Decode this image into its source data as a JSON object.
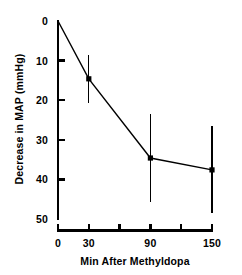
{
  "chart_data": {
    "type": "line",
    "title": "",
    "subtitle": "",
    "xlabel": "Min After Methyldopa",
    "ylabel": "Decrease in MAP (mmHg)",
    "xlim": [
      0,
      150
    ],
    "ylim": [
      0,
      50
    ],
    "y_axis_inverted": true,
    "grid": false,
    "legend": "none",
    "line_color": "#000000",
    "marker_color": "#000000",
    "marker": "square",
    "errorbar_style": "plain-vertical-no-caps",
    "x_ticks": [
      0,
      30,
      60,
      90,
      120,
      150
    ],
    "x_tick_labels": [
      "0",
      "30",
      "",
      "90",
      "",
      "150"
    ],
    "y_ticks": [
      0,
      10,
      20,
      30,
      40,
      50
    ],
    "y_tick_labels": [
      "0",
      "10",
      "20",
      "30",
      "40",
      "50"
    ],
    "x": [
      0,
      30,
      90,
      150
    ],
    "values": [
      0,
      14.6,
      34.6,
      37.6
    ],
    "errors": [
      0,
      6.0,
      11.0,
      11.0
    ],
    "points": [
      {
        "x": 0,
        "y": 0,
        "err": 0,
        "marker": false
      },
      {
        "x": 30,
        "y": 14.6,
        "err": 6.0,
        "marker": true
      },
      {
        "x": 90,
        "y": 34.6,
        "err": 11.0,
        "marker": true
      },
      {
        "x": 150,
        "y": 37.6,
        "err": 11.0,
        "marker": true
      }
    ],
    "series": [
      {
        "name": "Decrease in MAP",
        "x": [
          0,
          30,
          90,
          150
        ],
        "values": [
          0,
          14.6,
          34.6,
          37.6
        ],
        "errors": [
          0,
          6.0,
          11.0,
          11.0
        ]
      }
    ]
  }
}
